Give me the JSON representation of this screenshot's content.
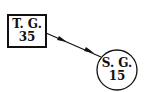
{
  "nodes": [
    {
      "id": "tg",
      "shape": "square",
      "label": "T. G.",
      "value": "35"
    },
    {
      "id": "sg",
      "shape": "circle",
      "label": "S. G.",
      "value": "15"
    }
  ],
  "edges": [
    {
      "from": "tg",
      "to": "sg",
      "arrowheads": 2
    }
  ]
}
